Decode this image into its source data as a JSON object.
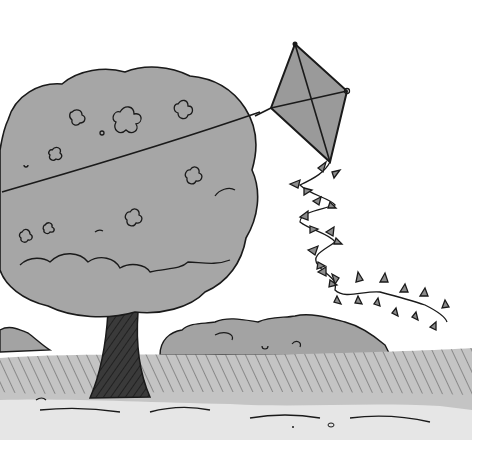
{
  "illustration": {
    "description": "Hand-drawn marker sketch of a diamond kite tangled in a large round tree, its bow-tied tail trailing down toward a grassy field",
    "style": "grayscale marker illustration",
    "colors": {
      "background": "#ffffff",
      "ink": "#1a1a1a",
      "foliage": "#a6a6a6",
      "foliage_dark": "#8c8c8c",
      "kite_fill": "#9a9a9a",
      "grass": "#b5b5b5",
      "trunk": "#3a3a3a"
    },
    "elements": [
      "tree",
      "kite",
      "kite-string",
      "kite-tail",
      "distant-bushes",
      "grass-field"
    ],
    "kite_tail_bows": 13
  }
}
